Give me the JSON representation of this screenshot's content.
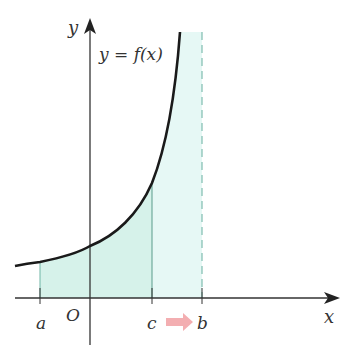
{
  "diagram": {
    "curve_label": "y = f(x)",
    "axis_x_label": "x",
    "axis_y_label": "y",
    "origin_label": "O",
    "points": [
      {
        "label": "a",
        "role": "lower limit"
      },
      {
        "label": "c",
        "role": "moving limit"
      },
      {
        "label": "b",
        "role": "asymptote / upper limit"
      }
    ],
    "arrow": "c approaches b (pink arrow)",
    "colors": {
      "curve": "#1a1a1a",
      "fill_a_to_c": "#d6f2ea",
      "fill_c_to_b": "#e6f8f5",
      "asymptote": "#7fbdb0",
      "arrow": "#f2a5a8",
      "axis": "#333333"
    }
  }
}
